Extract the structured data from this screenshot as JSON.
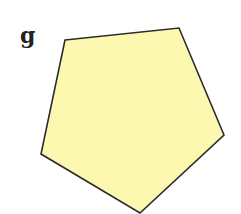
{
  "figure": {
    "label": "g",
    "shape": "pentagon",
    "fill_color": "#fdf8b0",
    "stroke_color": "#2b2b2b",
    "points": "65,40 179,28 224,135 140,213 41,154"
  }
}
